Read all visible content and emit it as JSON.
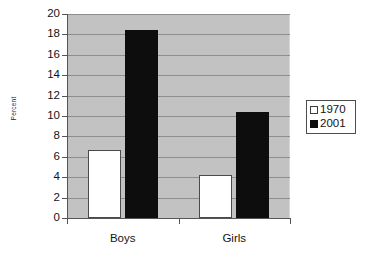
{
  "chart_data": {
    "type": "bar",
    "title": "",
    "subtitle": "",
    "xlabel": "",
    "ylabel": "Percent",
    "categories": [
      "Boys",
      "Girls"
    ],
    "series": [
      {
        "name": "1970",
        "values": [
          6.7,
          4.2
        ],
        "color": "#ffffff"
      },
      {
        "name": "2001",
        "values": [
          18.4,
          10.4
        ],
        "color": "#0d0d0d"
      }
    ],
    "ylim": [
      0,
      20
    ],
    "ytick_step": 2,
    "yticks": [
      0,
      2,
      4,
      6,
      8,
      10,
      12,
      14,
      16,
      18,
      20
    ],
    "ytick_labels": [
      "0",
      "2",
      "4",
      "6",
      "8",
      "10",
      "12",
      "14",
      "16",
      "18",
      "20"
    ],
    "grid": true,
    "grid_axis": "y",
    "legend_position": "right",
    "legend_entries": [
      "1970",
      "2001"
    ],
    "plot_background": "#c2c2c2",
    "page_background": "#ffffff"
  },
  "axis": {
    "y_title": "Percent"
  },
  "legend": {
    "items": [
      {
        "label": "1970",
        "marker": "hollow-square-marker"
      },
      {
        "label": "2001",
        "marker": "filled-square-marker"
      }
    ]
  }
}
